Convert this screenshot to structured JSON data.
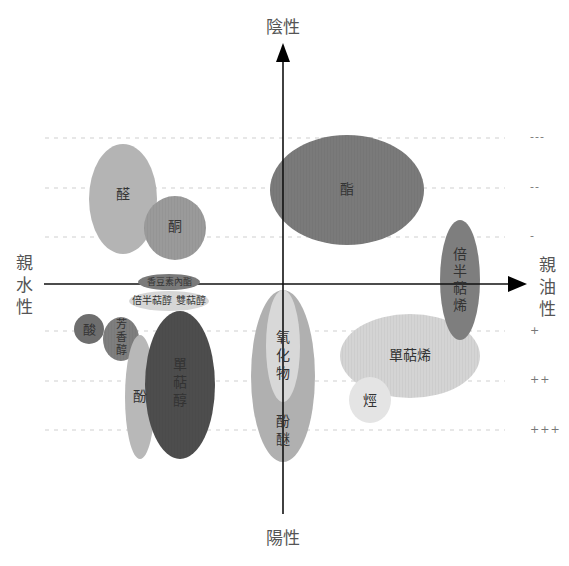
{
  "axes": {
    "top_label": "陰性",
    "bottom_label": "陽性",
    "left_label": "親水性",
    "right_label": "親油性"
  },
  "ticks": [
    {
      "label": "---",
      "y": 138
    },
    {
      "label": "--",
      "y": 188
    },
    {
      "label": "-",
      "y": 237
    },
    {
      "label": "+",
      "y": 331
    },
    {
      "label": "++",
      "y": 381
    },
    {
      "label": "+++",
      "y": 430
    }
  ],
  "colors": {
    "light": "#bdbdbd",
    "lighter": "#dcdcdc",
    "mid": "#a4a4a4",
    "medium_dark": "#8a8a8a",
    "dark": "#6e6e6e",
    "darkest": "#4a4a4a",
    "grid": "#cfcfcf",
    "axis": "#111111"
  },
  "groups": [
    {
      "name": "醛",
      "cx": 123,
      "cy": 199,
      "rx": 34,
      "ry": 55,
      "fill": "#b4b4b4"
    },
    {
      "name": "酮",
      "cx": 175,
      "cy": 228,
      "rx": 31,
      "ry": 32,
      "fill": "#9a9a9a"
    },
    {
      "name": "酯",
      "cx": 347,
      "cy": 190,
      "rx": 77,
      "ry": 55,
      "fill": "#7a7a7a"
    },
    {
      "name": "倍半萜烯",
      "cx": 460,
      "cy": 280,
      "rx": 20,
      "ry": 60,
      "fill": "#7e7e7e"
    },
    {
      "name": "香豆素內酯",
      "cx": 169,
      "cy": 282,
      "rx": 31,
      "ry": 8,
      "fill": "#7a7a7a"
    },
    {
      "name": "倍半萜醇 雙萜醇",
      "cx": 169,
      "cy": 301,
      "rx": 40,
      "ry": 10,
      "fill": "#d6d6d6"
    },
    {
      "name": "酸",
      "cx": 89,
      "cy": 329,
      "rx": 15,
      "ry": 15,
      "fill": "#6e6e6e"
    },
    {
      "name": "芳香醇",
      "cx": 121,
      "cy": 339,
      "rx": 18,
      "ry": 22,
      "fill": "#7e7e7e"
    },
    {
      "name": "酚",
      "cx": 140,
      "cy": 397,
      "rx": 15,
      "ry": 62,
      "fill": "#b8b8b8"
    },
    {
      "name": "單萜醇",
      "cx": 180,
      "cy": 385,
      "rx": 35,
      "ry": 74,
      "fill": "#4d4d4d"
    },
    {
      "name": "酚醚",
      "cx": 283,
      "cy": 376,
      "rx": 32,
      "ry": 86,
      "fill": "#b0b0b0"
    },
    {
      "name": "氧化物",
      "cx": 283,
      "cy": 346,
      "rx": 17,
      "ry": 56,
      "fill": "#d8d8d8"
    },
    {
      "name": "單萜烯",
      "cx": 410,
      "cy": 356,
      "rx": 70,
      "ry": 42,
      "fill": "#d4d4d4"
    },
    {
      "name": "烴",
      "cx": 370,
      "cy": 400,
      "rx": 21,
      "ry": 23,
      "fill": "#e4e4e4"
    }
  ],
  "labels": {
    "aldehyde": "醛",
    "ketone": "酮",
    "ester": "酯",
    "sesquiterpene": "倍半萜烯",
    "coumarin": "香豆素內酯",
    "sesqui_diterpenol": "倍半萜醇 雙萜醇",
    "acid": "酸",
    "aromatic_alcohol": "芳香醇",
    "phenol": "酚",
    "monoterpenol": "單萜醇",
    "oxide": "氧化物",
    "phenol_ether": "酚醚",
    "monoterpene": "單萜烯",
    "hydrocarbon": "烴"
  }
}
